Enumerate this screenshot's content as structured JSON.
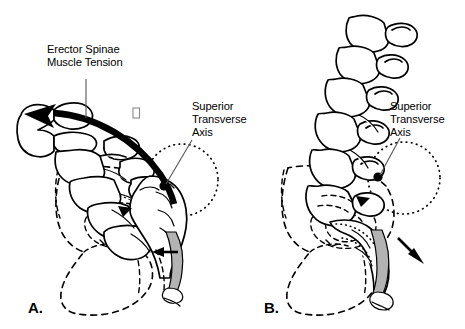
{
  "figure": {
    "background_color": "#ffffff",
    "ink_color": "#000000",
    "ligament_fill_color": "#b3b3b3",
    "leader_line_color": "#555555"
  },
  "panels": [
    {
      "id": "panel-a",
      "letter": "A.",
      "description": "Nutation of the sacrum produced by erector spinae muscle tension",
      "labels": [
        {
          "id": "erector-spinae",
          "text_lines": [
            "Erector Spinae",
            "Muscle Tension"
          ],
          "line1": "Erector Spinae",
          "line2": "Muscle Tension"
        },
        {
          "id": "superior-transverse-axis",
          "text_lines": [
            "Superior",
            "Transverse",
            "Axis"
          ],
          "line1": "Superior",
          "line2": "Transverse",
          "line3": "Axis"
        }
      ],
      "arrows": [
        {
          "id": "muscle-tension-arc",
          "kind": "thick-curved",
          "direction": "upper-left"
        },
        {
          "id": "sacral-base-arrow",
          "kind": "solid-triangle",
          "direction": "down-right"
        },
        {
          "id": "coccyx-arrow",
          "kind": "solid",
          "direction": "left"
        }
      ]
    },
    {
      "id": "panel-b",
      "letter": "B.",
      "description": "Counternutation of the sacrum about the superior transverse axis",
      "labels": [
        {
          "id": "superior-transverse-axis",
          "text_lines": [
            "Superior",
            "Transverse",
            "Axis"
          ],
          "line1": "Superior",
          "line2": "Transverse",
          "line3": "Axis"
        }
      ],
      "arrows": [
        {
          "id": "sacral-base-arrow",
          "kind": "solid-triangle",
          "direction": "left"
        },
        {
          "id": "coccyx-arrow",
          "kind": "solid",
          "direction": "down-right"
        }
      ]
    }
  ],
  "artifacts": [
    {
      "id": "missing-glyph-box",
      "text": "□",
      "note": "small empty rectangle glyph"
    }
  ]
}
